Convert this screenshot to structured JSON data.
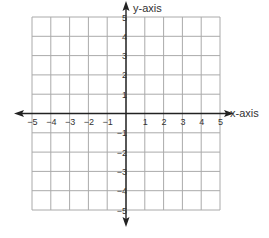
{
  "chart_data": {
    "type": "scatter",
    "title": "",
    "xlabel": "x-axis",
    "ylabel": "y-axis",
    "xlim": [
      -5,
      5
    ],
    "ylim": [
      -5,
      5
    ],
    "grid": true,
    "x_ticks": [
      -5,
      -4,
      -3,
      -2,
      -1,
      1,
      2,
      3,
      4,
      5
    ],
    "y_ticks": [
      -5,
      -4,
      -3,
      -2,
      -1,
      1,
      2,
      3,
      4,
      5
    ],
    "x_tick_labels": [
      "−5",
      "−4",
      "−3",
      "−2",
      "−1",
      "1",
      "2",
      "3",
      "4",
      "5"
    ],
    "y_tick_labels": [
      "−5",
      "−4",
      "−3",
      "−2",
      "−1",
      "1",
      "2",
      "3",
      "4",
      "5"
    ],
    "series": [],
    "axes_arrows": true
  },
  "colors": {
    "grid": "#aaaaaa",
    "axis": "#222222",
    "label": "#333333",
    "background": "#ffffff"
  },
  "layout": {
    "x0_px": 32,
    "x1_px": 220,
    "y0_px": 17,
    "y1_px": 210,
    "origin_x_px": 126,
    "origin_y_px": 113
  }
}
